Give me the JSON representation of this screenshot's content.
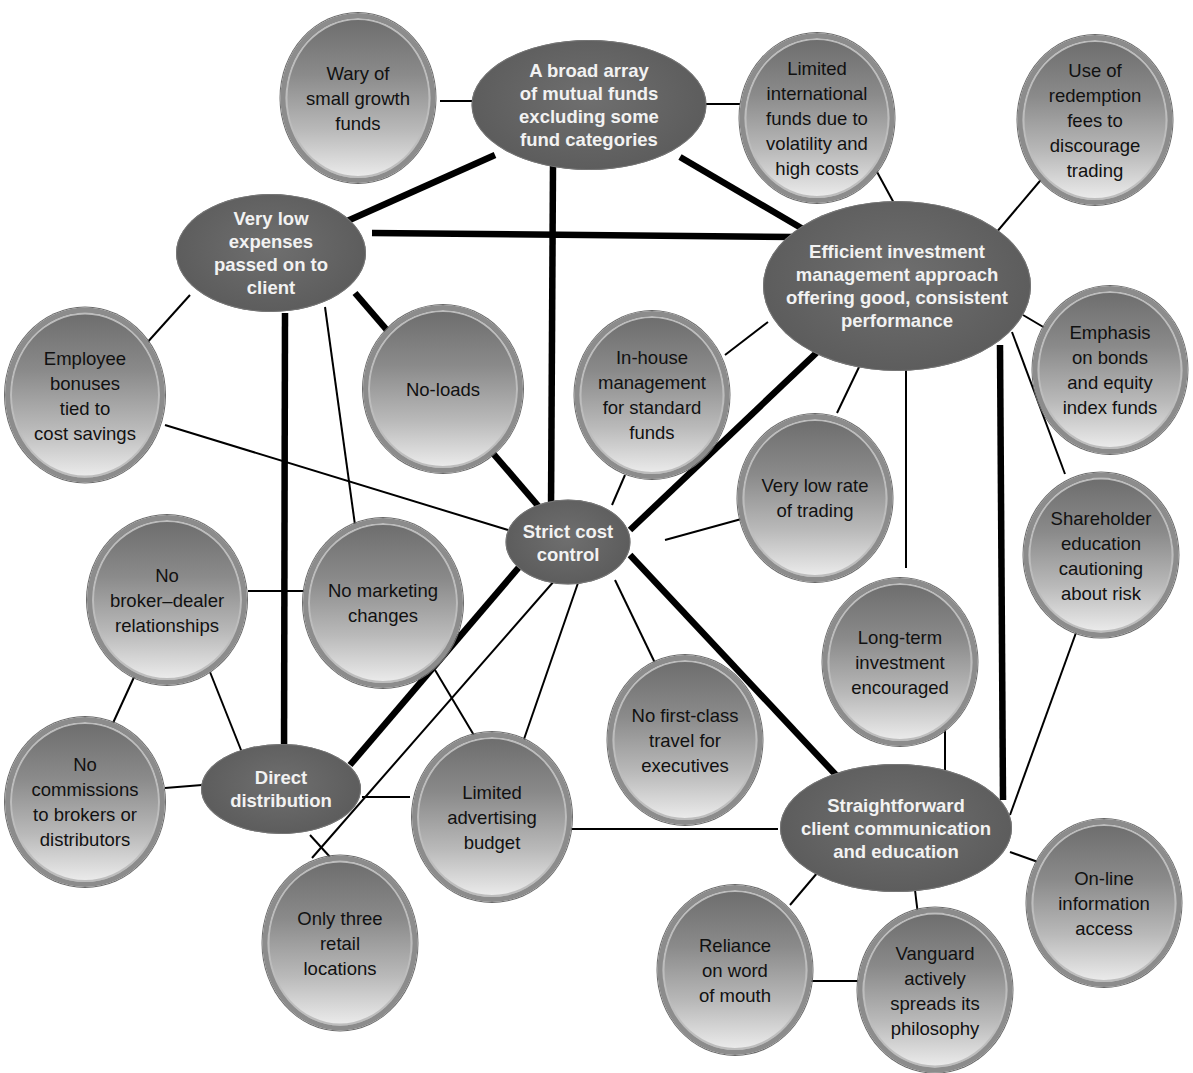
{
  "diagram": {
    "type": "activity-system-map",
    "colors": {
      "hub_fill": "#5e5e5e",
      "hub_text": "#f2f2f2",
      "leaf_fill_top": "#6d6d6d",
      "leaf_fill_bottom": "#ececec",
      "leaf_text": "#111111",
      "edge": "#000000"
    },
    "hubs": {
      "broad_array": "A broad array\nof mutual funds\nexcluding some\nfund categories",
      "very_low_expenses": "Very low\nexpenses\npassed on to\nclient",
      "efficient_investment": "Efficient investment\nmanagement approach\noffering good, consistent\nperformance",
      "strict_cost_control": "Strict cost\ncontrol",
      "direct_distribution": "Direct\ndistribution",
      "straightforward_communication": "Straightforward\nclient communication\nand education"
    },
    "leaves": {
      "wary_small_growth": "Wary of\nsmall growth\nfunds",
      "limited_international": "Limited\ninternational\nfunds due to\nvolatility and\nhigh costs",
      "redemption_fees": "Use of\nredemption\nfees to\ndiscourage\ntrading",
      "employee_bonuses": "Employee\nbonuses\ntied to\ncost savings",
      "no_loads": "No-loads",
      "in_house_management": "In-house\nmanagement\nfor standard\nfunds",
      "emphasis_bonds_index": "Emphasis\non bonds\nand equity\nindex funds",
      "very_low_trading": "Very low rate\nof trading",
      "shareholder_education": "Shareholder\neducation\ncautioning\nabout risk",
      "no_broker_dealer": "No\nbroker–dealer\nrelationships",
      "no_marketing_changes": "No marketing\nchanges",
      "long_term_investment": "Long-term\ninvestment\nencouraged",
      "no_first_class": "No first-class\ntravel for\nexecutives",
      "no_commissions": "No\ncommissions\nto brokers or\ndistributors",
      "limited_advertising": "Limited\nadvertising\nbudget",
      "only_three_retail": "Only three\nretail\nlocations",
      "online_information": "On-line\ninformation\naccess",
      "reliance_word_of_mouth": "Reliance\non word\nof mouth",
      "vanguard_spreads": "Vanguard\nactively\nspreads its\nphilosophy"
    },
    "edges": [
      {
        "from": "broad_array",
        "to": "wary_small_growth",
        "weight": "thin"
      },
      {
        "from": "broad_array",
        "to": "limited_international",
        "weight": "thin"
      },
      {
        "from": "broad_array",
        "to": "very_low_expenses",
        "weight": "thick"
      },
      {
        "from": "broad_array",
        "to": "strict_cost_control",
        "weight": "thick"
      },
      {
        "from": "broad_array",
        "to": "efficient_investment",
        "weight": "thick"
      },
      {
        "from": "very_low_expenses",
        "to": "efficient_investment",
        "weight": "thick"
      },
      {
        "from": "very_low_expenses",
        "to": "strict_cost_control",
        "weight": "thick"
      },
      {
        "from": "very_low_expenses",
        "to": "direct_distribution",
        "weight": "thick"
      },
      {
        "from": "very_low_expenses",
        "to": "employee_bonuses",
        "weight": "thin"
      },
      {
        "from": "very_low_expenses",
        "to": "no_marketing_changes",
        "weight": "thin"
      },
      {
        "from": "limited_international",
        "to": "efficient_investment",
        "weight": "thin"
      },
      {
        "from": "redemption_fees",
        "to": "efficient_investment",
        "weight": "thin"
      },
      {
        "from": "efficient_investment",
        "to": "in_house_management",
        "weight": "thin"
      },
      {
        "from": "efficient_investment",
        "to": "strict_cost_control",
        "weight": "thick"
      },
      {
        "from": "efficient_investment",
        "to": "very_low_trading",
        "weight": "thin"
      },
      {
        "from": "efficient_investment",
        "to": "long_term_investment",
        "weight": "thin"
      },
      {
        "from": "efficient_investment",
        "to": "straightforward_communication",
        "weight": "thick"
      },
      {
        "from": "efficient_investment",
        "to": "emphasis_bonds_index",
        "weight": "thin"
      },
      {
        "from": "efficient_investment",
        "to": "shareholder_education",
        "weight": "thin"
      },
      {
        "from": "employee_bonuses",
        "to": "strict_cost_control",
        "weight": "thin"
      },
      {
        "from": "in_house_management",
        "to": "strict_cost_control",
        "weight": "thin"
      },
      {
        "from": "very_low_trading",
        "to": "strict_cost_control",
        "weight": "thin"
      },
      {
        "from": "strict_cost_control",
        "to": "direct_distribution",
        "weight": "thick"
      },
      {
        "from": "strict_cost_control",
        "to": "straightforward_communication",
        "weight": "thick"
      },
      {
        "from": "strict_cost_control",
        "to": "no_first_class",
        "weight": "thin"
      },
      {
        "from": "strict_cost_control",
        "to": "limited_advertising",
        "weight": "thin"
      },
      {
        "from": "strict_cost_control",
        "to": "only_three_retail",
        "weight": "thin"
      },
      {
        "from": "no_broker_dealer",
        "to": "no_marketing_changes",
        "weight": "thin"
      },
      {
        "from": "no_broker_dealer",
        "to": "no_commissions",
        "weight": "thin"
      },
      {
        "from": "no_broker_dealer",
        "to": "direct_distribution",
        "weight": "thin"
      },
      {
        "from": "no_marketing_changes",
        "to": "limited_advertising",
        "weight": "thin"
      },
      {
        "from": "no_commissions",
        "to": "direct_distribution",
        "weight": "thin"
      },
      {
        "from": "direct_distribution",
        "to": "limited_advertising",
        "weight": "thin"
      },
      {
        "from": "direct_distribution",
        "to": "only_three_retail",
        "weight": "thin"
      },
      {
        "from": "limited_advertising",
        "to": "straightforward_communication",
        "weight": "thin"
      },
      {
        "from": "long_term_investment",
        "to": "straightforward_communication",
        "weight": "thin"
      },
      {
        "from": "shareholder_education",
        "to": "straightforward_communication",
        "weight": "thin"
      },
      {
        "from": "straightforward_communication",
        "to": "online_information",
        "weight": "thin"
      },
      {
        "from": "straightforward_communication",
        "to": "reliance_word_of_mouth",
        "weight": "thin"
      },
      {
        "from": "straightforward_communication",
        "to": "vanguard_spreads",
        "weight": "thin"
      },
      {
        "from": "reliance_word_of_mouth",
        "to": "vanguard_spreads",
        "weight": "thin"
      }
    ]
  }
}
